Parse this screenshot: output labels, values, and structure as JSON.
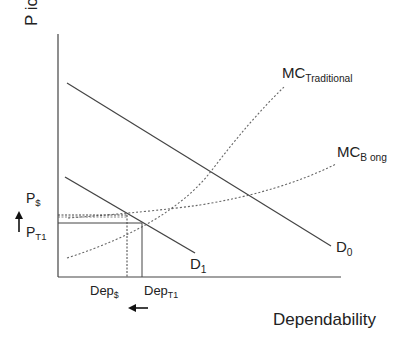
{
  "diagram": {
    "type": "supply-demand",
    "y_axis_label": "P ice",
    "x_axis_label": "Dependability",
    "curves": [
      {
        "id": "D0",
        "label": "D",
        "sub": "0",
        "style": "solid"
      },
      {
        "id": "D1",
        "label": "D",
        "sub": "1",
        "style": "solid"
      },
      {
        "id": "MC_traditional",
        "label": "MC",
        "sub": "Traditional",
        "style": "dotted"
      },
      {
        "id": "MC_bong",
        "label": "MC",
        "sub": "B ong",
        "style": "dotted"
      }
    ],
    "price_labels": {
      "p_dollar": {
        "label": "P",
        "sub": "$"
      },
      "p_t1": {
        "label": "P",
        "sub": "T1"
      }
    },
    "quantity_labels": {
      "dep_dollar": {
        "label": "Dep",
        "sub": "$"
      },
      "dep_t1": {
        "label": "Dep",
        "sub": "T1"
      }
    },
    "arrows": [
      {
        "id": "price-up-arrow",
        "direction": "up"
      },
      {
        "id": "dependability-left-arrow",
        "direction": "left"
      }
    ]
  }
}
